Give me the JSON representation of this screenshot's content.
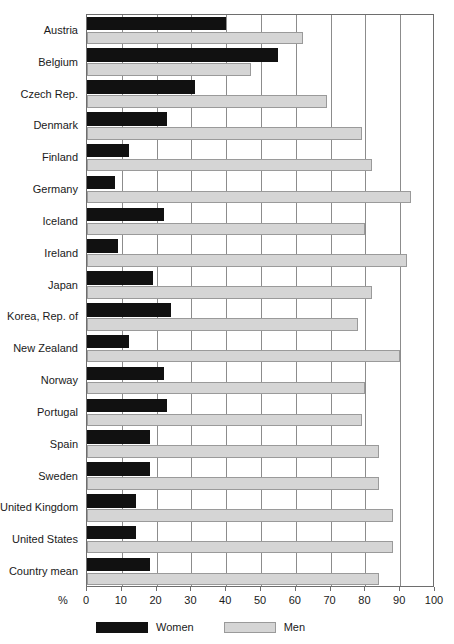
{
  "chart_data": {
    "type": "bar",
    "orientation": "horizontal",
    "title": "",
    "subtitle": "",
    "xlabel": "%",
    "ylabel": "",
    "xlim": [
      0,
      100
    ],
    "xticks": [
      0,
      10,
      20,
      30,
      40,
      50,
      60,
      70,
      80,
      90,
      100
    ],
    "xticklabels": [
      "0",
      "10",
      "20",
      "30",
      "40",
      "50",
      "60",
      "70",
      "80",
      "90",
      "100"
    ],
    "grid": "vertical",
    "legend_position": "bottom-left",
    "categories": [
      "Austria",
      "Belgium",
      "Czech Rep.",
      "Denmark",
      "Finland",
      "Germany",
      "Iceland",
      "Ireland",
      "Japan",
      "Korea, Rep. of",
      "New Zealand",
      "Norway",
      "Portugal",
      "Spain",
      "Sweden",
      "United Kingdom",
      "United States",
      "Country mean"
    ],
    "series": [
      {
        "name": "Women",
        "color": "#111111",
        "values": [
          40,
          55,
          31,
          23,
          12,
          8,
          22,
          9,
          19,
          24,
          12,
          22,
          23,
          18,
          18,
          14,
          14,
          18
        ]
      },
      {
        "name": "Men",
        "color": "#d5d5d5",
        "values": [
          62,
          47,
          69,
          79,
          82,
          93,
          80,
          92,
          82,
          78,
          90,
          80,
          79,
          84,
          84,
          88,
          88,
          84
        ]
      }
    ]
  },
  "axis": {
    "percent_symbol": "%"
  },
  "legend": {
    "items": [
      {
        "label": "Women",
        "swatch": "black-square-swatch"
      },
      {
        "label": "Men",
        "swatch": "gray-square-swatch"
      }
    ]
  }
}
